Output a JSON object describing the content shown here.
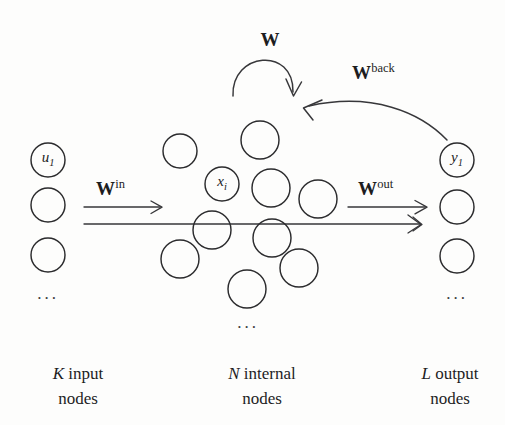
{
  "figure": {
    "type": "echo-state-network-diagram",
    "background_color": "#fdfdfc",
    "ink_color": "#2b2b2d",
    "width": 505,
    "height": 425
  },
  "weights": {
    "recurrent": {
      "base": "W",
      "sup": "",
      "x": 270,
      "y": 30
    },
    "input": {
      "base": "W",
      "sup": "in",
      "x": 96,
      "y": 178
    },
    "output": {
      "base": "W",
      "sup": "out",
      "x": 358,
      "y": 178
    },
    "feedback": {
      "base": "W",
      "sup": "back",
      "x": 352,
      "y": 62
    }
  },
  "nodes": {
    "input_label": {
      "base": "u",
      "sub": "1"
    },
    "internal_label": {
      "base": "x",
      "sub": "i"
    },
    "output_label": {
      "base": "y",
      "sub": "1"
    },
    "input_circles": [
      {
        "cx": 48,
        "cy": 160,
        "r": 17,
        "label": "u1"
      },
      {
        "cx": 48,
        "cy": 205,
        "r": 17,
        "label": ""
      },
      {
        "cx": 48,
        "cy": 255,
        "r": 17,
        "label": ""
      }
    ],
    "internal_circles": [
      {
        "cx": 180,
        "cy": 151,
        "r": 17,
        "label": ""
      },
      {
        "cx": 260,
        "cy": 140,
        "r": 19,
        "label": ""
      },
      {
        "cx": 222,
        "cy": 184,
        "r": 17,
        "label": "xi"
      },
      {
        "cx": 271,
        "cy": 188,
        "r": 19,
        "label": ""
      },
      {
        "cx": 318,
        "cy": 199,
        "r": 19,
        "label": ""
      },
      {
        "cx": 212,
        "cy": 230,
        "r": 19,
        "label": ""
      },
      {
        "cx": 272,
        "cy": 238,
        "r": 19,
        "label": ""
      },
      {
        "cx": 180,
        "cy": 259,
        "r": 19,
        "label": ""
      },
      {
        "cx": 299,
        "cy": 268,
        "r": 19,
        "label": ""
      },
      {
        "cx": 247,
        "cy": 289,
        "r": 19,
        "label": ""
      }
    ],
    "output_circles": [
      {
        "cx": 457,
        "cy": 160,
        "r": 17,
        "label": "y1"
      },
      {
        "cx": 457,
        "cy": 207,
        "r": 17,
        "label": ""
      },
      {
        "cx": 457,
        "cy": 256,
        "r": 17,
        "label": ""
      }
    ],
    "ellipses": [
      {
        "x": 48,
        "y": 293,
        "text": "..."
      },
      {
        "x": 248,
        "y": 322,
        "text": "..."
      },
      {
        "x": 457,
        "y": 293,
        "text": "..."
      }
    ]
  },
  "captions": [
    {
      "emphasis": "K",
      "line1": " input",
      "line2": "nodes",
      "x": 78,
      "y": 362
    },
    {
      "emphasis": "N",
      "line1": " internal",
      "line2": "nodes",
      "x": 262,
      "y": 362
    },
    {
      "emphasis": "L",
      "line1": " output",
      "line2": "nodes",
      "x": 450,
      "y": 362
    }
  ]
}
